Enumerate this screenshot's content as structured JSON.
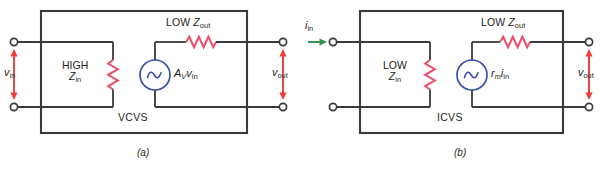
{
  "figure": {
    "colors": {
      "wire": "#3a3a3c",
      "resistor": "#e8536b",
      "source": "#3b4ea8",
      "voltage_arrow": "#ef3e33",
      "current_arrow": "#2f8f4e",
      "text": "#231f20",
      "background": "#ffffff"
    }
  },
  "panels": [
    {
      "id": "a",
      "caption": "(a)",
      "block_label": "VCVS",
      "input_label": {
        "base": "v",
        "sub": "in"
      },
      "output_label": {
        "base": "v",
        "sub": "out"
      },
      "input_arrow_type": "voltage-double-arrow",
      "input_resistor_label": {
        "line1": "HIGH",
        "line2_base": "Z",
        "line2_sub": "in"
      },
      "output_resistor_label": {
        "line1": "LOW",
        "base": "Z",
        "sub": "out"
      },
      "source_label": {
        "base": "A",
        "sub1": "V",
        "base2": "v",
        "sub2": "in"
      },
      "source_symbol": "sine-wave"
    },
    {
      "id": "b",
      "caption": "(b)",
      "block_label": "ICVS",
      "input_label": {
        "base": "i",
        "sub": "in"
      },
      "output_label": {
        "base": "v",
        "sub": "out"
      },
      "input_arrow_type": "current-single-arrow",
      "input_resistor_label": {
        "line1": "LOW",
        "line2_base": "Z",
        "line2_sub": "in"
      },
      "output_resistor_label": {
        "line1": "LOW",
        "base": "Z",
        "sub": "out"
      },
      "source_label": {
        "base": "r",
        "sub1": "m",
        "base2": "i",
        "sub2": "in"
      },
      "source_symbol": "sine-wave"
    }
  ]
}
